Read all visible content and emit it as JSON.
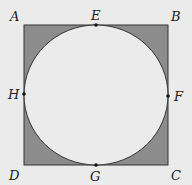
{
  "diagram": {
    "title": "",
    "shape": "square with inscribed circle, corner regions shaded",
    "colors": {
      "background": "#ebebeb",
      "shaded": "#8c8c8c",
      "stroke": "#333333",
      "circle_fill": "#ebebeb"
    },
    "square": {
      "x": 24,
      "y": 25,
      "size": 144
    },
    "circle": {
      "cx": 96,
      "cy": 97,
      "r": 72
    },
    "points": [
      {
        "id": "A",
        "label": "A",
        "x": 14,
        "y": 21
      },
      {
        "id": "B",
        "label": "B",
        "x": 172,
        "y": 21
      },
      {
        "id": "C",
        "label": "C",
        "x": 172,
        "y": 179
      },
      {
        "id": "D",
        "label": "D",
        "x": 10,
        "y": 179
      },
      {
        "id": "E",
        "label": "E",
        "x": 91,
        "y": 21
      },
      {
        "id": "F",
        "label": "F",
        "x": 174,
        "y": 101
      },
      {
        "id": "G",
        "label": "G",
        "x": 91,
        "y": 180
      },
      {
        "id": "H",
        "label": "H",
        "x": 9,
        "y": 101
      }
    ]
  }
}
